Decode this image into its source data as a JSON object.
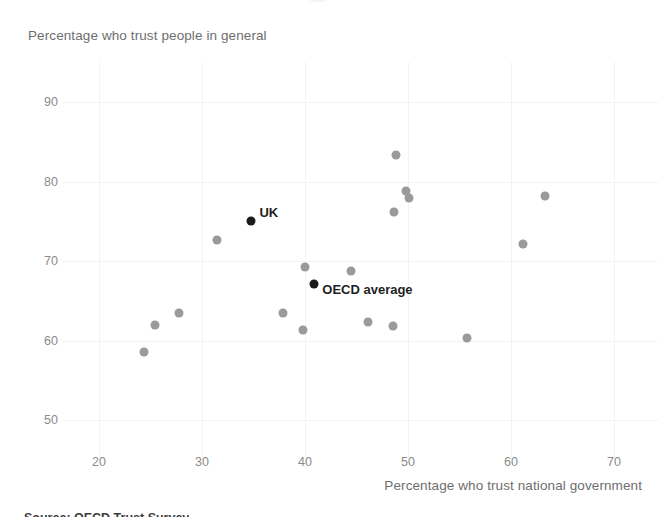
{
  "chart_data": {
    "type": "scatter",
    "title": "",
    "xlabel": "Percentage who trust national government",
    "ylabel": "Percentage who trust people in general",
    "xlim": [
      17,
      73
    ],
    "ylim": [
      46,
      92
    ],
    "xticks": [
      20,
      30,
      40,
      50,
      60,
      70
    ],
    "yticks": [
      50,
      60,
      70,
      80,
      90
    ],
    "grid": true,
    "legend": "none",
    "series": [
      {
        "name": "OECD countries",
        "color": "#9a9a9a",
        "points": [
          {
            "x": 24.4,
            "y": 58.6
          },
          {
            "x": 25.4,
            "y": 61.9
          },
          {
            "x": 27.8,
            "y": 63.4
          },
          {
            "x": 31.5,
            "y": 72.7
          },
          {
            "x": 37.9,
            "y": 63.4
          },
          {
            "x": 39.8,
            "y": 61.3
          },
          {
            "x": 40.0,
            "y": 69.3
          },
          {
            "x": 44.5,
            "y": 68.7
          },
          {
            "x": 46.1,
            "y": 62.3
          },
          {
            "x": 48.5,
            "y": 61.8
          },
          {
            "x": 48.6,
            "y": 76.2
          },
          {
            "x": 48.8,
            "y": 83.3
          },
          {
            "x": 49.8,
            "y": 78.8
          },
          {
            "x": 50.1,
            "y": 77.9
          },
          {
            "x": 55.7,
            "y": 60.3
          },
          {
            "x": 61.2,
            "y": 72.2
          },
          {
            "x": 63.3,
            "y": 78.2
          }
        ]
      },
      {
        "name": "Highlighted",
        "color": "#1a1a1a",
        "points": [
          {
            "x": 34.8,
            "y": 75.0,
            "label": "UK",
            "label_dx": 8,
            "label_dy": -9
          },
          {
            "x": 40.9,
            "y": 67.1,
            "label": "OECD average",
            "label_dx": 8,
            "label_dy": 5
          }
        ]
      }
    ]
  },
  "axes": {
    "y_title": "Percentage who trust people in general",
    "x_title": "Percentage who trust national government",
    "y_tick_labels": [
      "90",
      "80",
      "70",
      "60",
      "50"
    ],
    "x_tick_labels": [
      "20",
      "30",
      "40",
      "50",
      "60",
      "70"
    ]
  },
  "annotations": {
    "uk_label": "UK",
    "oecd_label": "OECD average"
  },
  "footer": {
    "source_clipped": "Source: OECD Trust Survey"
  },
  "colors": {
    "point": "#9a9a9a",
    "highlight": "#1a1a1a",
    "grid": "#f2f3f5",
    "text": "#6e6e6e",
    "tick_text": "#8a8a8a"
  }
}
